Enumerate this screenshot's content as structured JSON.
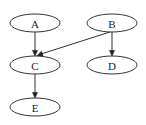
{
  "diagram": {
    "type": "directed-graph",
    "background": "#ffffff",
    "stroke_color": "#333333",
    "text_color": "#222222",
    "nodes": [
      {
        "id": "A",
        "label": "A",
        "shape": "ellipse",
        "cx": 35,
        "cy": 23,
        "rx": 25,
        "ry": 9
      },
      {
        "id": "B",
        "label": "B",
        "shape": "ellipse",
        "cx": 112,
        "cy": 23,
        "rx": 25,
        "ry": 9
      },
      {
        "id": "C",
        "label": "C",
        "shape": "ellipse",
        "cx": 35,
        "cy": 65,
        "rx": 25,
        "ry": 9
      },
      {
        "id": "D",
        "label": "D",
        "shape": "ellipse",
        "cx": 112,
        "cy": 65,
        "rx": 25,
        "ry": 9
      },
      {
        "id": "E",
        "label": "E",
        "shape": "ellipse",
        "cx": 35,
        "cy": 107,
        "rx": 25,
        "ry": 9
      }
    ],
    "edges": [
      {
        "from": "A",
        "to": "C"
      },
      {
        "from": "B",
        "to": "C"
      },
      {
        "from": "B",
        "to": "D"
      },
      {
        "from": "C",
        "to": "E"
      }
    ]
  }
}
